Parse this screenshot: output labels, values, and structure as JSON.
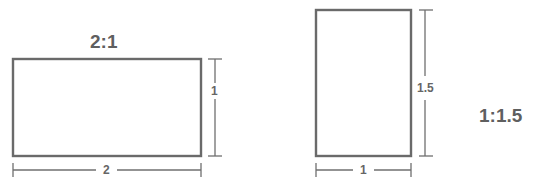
{
  "diagram": {
    "stroke_color": "#6a6a6a",
    "text_color": "#666666",
    "shapes": [
      {
        "name": "landscape",
        "ratio_label": "2:1",
        "width_label": "2",
        "height_label": "1",
        "rect": {
          "x": 13,
          "y": 59,
          "w": 188,
          "h": 97
        }
      },
      {
        "name": "portrait",
        "ratio_label": "1:1.5",
        "width_label": "1",
        "height_label": "1.5",
        "rect": {
          "x": 316,
          "y": 10,
          "w": 95,
          "h": 146
        }
      }
    ]
  }
}
